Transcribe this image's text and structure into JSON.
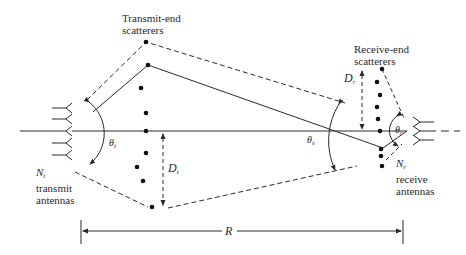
{
  "diagram": {
    "type": "MIMO scattering channel model",
    "colors": {
      "ink": "#2a2a2a",
      "background": "#ffffff"
    },
    "labels": {
      "transmit_scatterers": [
        "Transmit-end",
        "scatterers"
      ],
      "receive_scatterers": [
        "Receive-end",
        "scatterers"
      ],
      "tx_antennas": {
        "symbol": "N",
        "sub": "t",
        "lines": [
          "transmit",
          "antennas"
        ]
      },
      "rx_antennas": {
        "symbol": "N",
        "sub": "r",
        "lines": [
          "receive",
          "antennas"
        ]
      },
      "theta_t": {
        "symbol": "θ",
        "sub": "t"
      },
      "theta_s": {
        "symbol": "θ",
        "sub": "s"
      },
      "theta_r": {
        "symbol": "θ",
        "sub": "r"
      },
      "D_t": {
        "symbol": "D",
        "sub": "t"
      },
      "D_r": {
        "symbol": "D",
        "sub": "r"
      },
      "range": "R"
    },
    "tx_antenna_count_drawn": 5,
    "rx_antenna_count_drawn": 3,
    "tx_scatterer_points": [
      [
        146,
        42
      ],
      [
        148,
        65
      ],
      [
        141,
        88
      ],
      [
        146,
        113
      ],
      [
        146,
        131
      ],
      [
        146,
        153
      ],
      [
        137,
        167
      ],
      [
        143,
        181
      ],
      [
        152,
        207
      ]
    ],
    "rx_scatterer_points": [
      [
        382,
        69
      ],
      [
        377,
        82
      ],
      [
        380,
        95
      ],
      [
        377,
        107
      ],
      [
        378,
        119
      ],
      [
        380,
        131
      ],
      [
        381,
        149
      ],
      [
        381,
        156
      ],
      [
        382,
        166
      ]
    ]
  }
}
